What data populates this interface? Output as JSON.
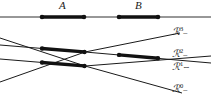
{
  "figure": {
    "title": "",
    "background": "#ffffff",
    "line_color": "#1a1a1a",
    "thin_stroke": 0.9,
    "thick_stroke": 3.2,
    "dot_color": "#111111",
    "dot_radius": 2.1,
    "width": 211,
    "height": 101
  },
  "top_axis": {
    "name": "top-horizontal-axis",
    "y": 17,
    "x_start": 0,
    "x_end": 211,
    "segments": [
      {
        "label": "A",
        "label_x": 62,
        "label_y": 1,
        "x1": 42,
        "x2": 84,
        "bold": true,
        "endpoint_dots": true
      },
      {
        "label": "B",
        "label_x": 137,
        "label_y": 1,
        "x1": 119,
        "x2": 158,
        "bold": true,
        "endpoint_dots": true
      }
    ]
  },
  "rays": [
    {
      "id": "R3",
      "label_base": "ℛ",
      "label_sup": "3",
      "label_tail": "–",
      "label_x": 175,
      "label_y": 27,
      "path": "M 0,82 L 85,52 L 175,33",
      "bold_parts": []
    },
    {
      "id": "R2",
      "label_base": "ℛ",
      "label_sup": "2",
      "label_tail": "–",
      "label_x": 175,
      "label_y": 49,
      "path": "M 0,45 L 85,52 L 211,62",
      "bold_parts": [
        {
          "x1": 42,
          "y1": 48.4,
          "x2": 84,
          "y2": 51.9
        },
        {
          "x1": 119,
          "y1": 54.7,
          "x2": 158,
          "y2": 57.8
        }
      ]
    },
    {
      "id": "R1",
      "label_base": "ℛ",
      "label_sup": "1",
      "label_tail": "∼",
      "label_x": 175,
      "label_y": 62,
      "path": "M 0,59 L 85,66 L 211,57",
      "bold_parts": [
        {
          "x1": 42,
          "y1": 62.4,
          "x2": 84,
          "y2": 65.9
        }
      ]
    },
    {
      "id": "R0",
      "label_base": "ℛ",
      "label_sup": "0",
      "label_tail": "–",
      "label_x": 175,
      "label_y": 84,
      "path": "M 0,38 L 85,66 L 180,93"
    }
  ],
  "crossing_nodes": [
    {
      "x": 85,
      "y": 52,
      "name": "node-upper-crossing"
    },
    {
      "x": 85,
      "y": 66,
      "name": "node-lower-crossing"
    },
    {
      "x": 42,
      "y": 48,
      "name": "node-a-left-upper"
    },
    {
      "x": 42,
      "y": 62,
      "name": "node-a-left-lower"
    },
    {
      "x": 119,
      "y": 55,
      "name": "node-b-left"
    },
    {
      "x": 158,
      "y": 58,
      "name": "node-b-right"
    }
  ]
}
